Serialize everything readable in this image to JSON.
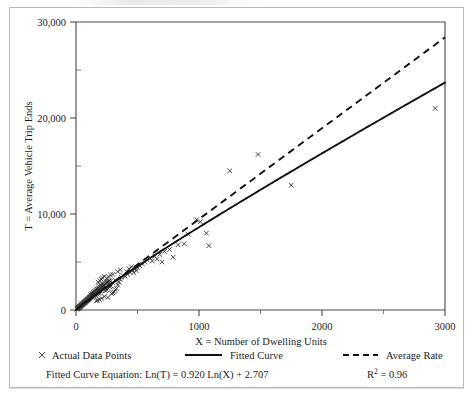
{
  "chart_data": {
    "type": "scatter",
    "title": "",
    "xlabel": "X = Number of Dwelling Units",
    "ylabel": "T = Average Vehicle Trip Ends",
    "xlim": [
      0,
      3000
    ],
    "ylim": [
      0,
      30000
    ],
    "xticks": [
      0,
      1000,
      2000,
      3000
    ],
    "xtick_labels": [
      "0",
      "1000",
      "2000",
      "3000"
    ],
    "yticks": [
      0,
      10000,
      20000,
      30000
    ],
    "ytick_labels": [
      "0",
      "10,000",
      "20,000",
      "30,000"
    ],
    "yticks_minor": [
      5000,
      15000,
      25000
    ],
    "grid": false,
    "legend_position": "below-axes",
    "series": [
      {
        "name": "Actual Data Points",
        "type": "scatter",
        "marker": "x",
        "points": [
          [
            8,
            90
          ],
          [
            12,
            130
          ],
          [
            15,
            160
          ],
          [
            18,
            200
          ],
          [
            20,
            230
          ],
          [
            22,
            250
          ],
          [
            25,
            280
          ],
          [
            28,
            320
          ],
          [
            30,
            350
          ],
          [
            32,
            370
          ],
          [
            35,
            400
          ],
          [
            38,
            430
          ],
          [
            40,
            460
          ],
          [
            42,
            480
          ],
          [
            45,
            510
          ],
          [
            48,
            540
          ],
          [
            50,
            570
          ],
          [
            52,
            600
          ],
          [
            55,
            630
          ],
          [
            58,
            660
          ],
          [
            60,
            690
          ],
          [
            63,
            720
          ],
          [
            65,
            740
          ],
          [
            68,
            780
          ],
          [
            70,
            800
          ],
          [
            73,
            830
          ],
          [
            75,
            860
          ],
          [
            78,
            890
          ],
          [
            80,
            910
          ],
          [
            83,
            950
          ],
          [
            85,
            980
          ],
          [
            88,
            1000
          ],
          [
            90,
            1040
          ],
          [
            93,
            1060
          ],
          [
            95,
            1090
          ],
          [
            98,
            1120
          ],
          [
            100,
            1150
          ],
          [
            103,
            1180
          ],
          [
            105,
            1210
          ],
          [
            108,
            1240
          ],
          [
            110,
            1260
          ],
          [
            113,
            1300
          ],
          [
            115,
            1320
          ],
          [
            118,
            1350
          ],
          [
            120,
            1380
          ],
          [
            123,
            1410
          ],
          [
            125,
            1440
          ],
          [
            128,
            1470
          ],
          [
            130,
            1490
          ],
          [
            133,
            1530
          ],
          [
            135,
            1550
          ],
          [
            138,
            1580
          ],
          [
            140,
            1610
          ],
          [
            143,
            1640
          ],
          [
            145,
            1660
          ],
          [
            148,
            1700
          ],
          [
            150,
            1720
          ],
          [
            155,
            1780
          ],
          [
            160,
            1830
          ],
          [
            165,
            1890
          ],
          [
            170,
            1940
          ],
          [
            175,
            2000
          ],
          [
            180,
            2050
          ],
          [
            185,
            2110
          ],
          [
            190,
            2160
          ],
          [
            195,
            2220
          ],
          [
            200,
            2270
          ],
          [
            205,
            2330
          ],
          [
            210,
            2380
          ],
          [
            215,
            2440
          ],
          [
            220,
            2490
          ],
          [
            225,
            2550
          ],
          [
            230,
            2600
          ],
          [
            235,
            2660
          ],
          [
            240,
            2710
          ],
          [
            245,
            2770
          ],
          [
            250,
            2820
          ],
          [
            255,
            2880
          ],
          [
            260,
            2930
          ],
          [
            265,
            2990
          ],
          [
            270,
            3040
          ],
          [
            150,
            1450
          ],
          [
            160,
            1550
          ],
          [
            170,
            1650
          ],
          [
            180,
            1750
          ],
          [
            190,
            1850
          ],
          [
            200,
            1950
          ],
          [
            210,
            2050
          ],
          [
            220,
            2150
          ],
          [
            230,
            2250
          ],
          [
            240,
            2350
          ],
          [
            120,
            1600
          ],
          [
            130,
            1720
          ],
          [
            140,
            1840
          ],
          [
            150,
            1960
          ],
          [
            160,
            2080
          ],
          [
            170,
            2200
          ],
          [
            180,
            2320
          ],
          [
            190,
            2440
          ],
          [
            200,
            2560
          ],
          [
            215,
            2700
          ],
          [
            180,
            2900
          ],
          [
            195,
            3050
          ],
          [
            205,
            3200
          ],
          [
            215,
            3350
          ],
          [
            230,
            3500
          ],
          [
            240,
            2000
          ],
          [
            250,
            2100
          ],
          [
            260,
            2250
          ],
          [
            275,
            2400
          ],
          [
            285,
            2500
          ],
          [
            290,
            1700
          ],
          [
            300,
            1800
          ],
          [
            310,
            1900
          ],
          [
            320,
            2100
          ],
          [
            330,
            2250
          ],
          [
            250,
            3300
          ],
          [
            265,
            3450
          ],
          [
            280,
            3000
          ],
          [
            300,
            2800
          ],
          [
            320,
            3100
          ],
          [
            340,
            2600
          ],
          [
            350,
            2900
          ],
          [
            360,
            3200
          ],
          [
            370,
            3400
          ],
          [
            380,
            3600
          ],
          [
            400,
            3500
          ],
          [
            420,
            3700
          ],
          [
            440,
            3900
          ],
          [
            460,
            4100
          ],
          [
            480,
            4300
          ],
          [
            340,
            4000
          ],
          [
            360,
            4200
          ],
          [
            300,
            3700
          ],
          [
            280,
            3650
          ],
          [
            260,
            1300
          ],
          [
            210,
            1200
          ],
          [
            230,
            1400
          ],
          [
            190,
            1100
          ],
          [
            175,
            1000
          ],
          [
            165,
            950
          ],
          [
            500,
            4400
          ],
          [
            520,
            4600
          ],
          [
            540,
            4800
          ],
          [
            560,
            5000
          ],
          [
            580,
            5200
          ],
          [
            470,
            3900
          ],
          [
            490,
            4100
          ],
          [
            450,
            4500
          ],
          [
            430,
            4300
          ],
          [
            410,
            4000
          ],
          [
            600,
            5400
          ],
          [
            620,
            5100
          ],
          [
            640,
            5600
          ],
          [
            660,
            5300
          ],
          [
            680,
            5800
          ],
          [
            700,
            5000
          ],
          [
            720,
            6100
          ],
          [
            760,
            6300
          ],
          [
            790,
            5500
          ],
          [
            830,
            6800
          ],
          [
            880,
            6900
          ],
          [
            910,
            7900
          ],
          [
            980,
            9400
          ],
          [
            1010,
            9200
          ],
          [
            1060,
            8000
          ],
          [
            1080,
            6700
          ],
          [
            1250,
            14500
          ],
          [
            1480,
            16200
          ],
          [
            1750,
            13000
          ],
          [
            2920,
            21000
          ]
        ]
      },
      {
        "name": "Fitted Curve",
        "type": "line",
        "style": "solid",
        "equation": "Ln(T) = 0.920 Ln(X) + 2.707",
        "slope_log": 0.92,
        "intercept_log": 2.707,
        "endpoint_at_x3000": 23200
      },
      {
        "name": "Average Rate",
        "type": "line",
        "style": "dashed",
        "rate": 9.47,
        "endpoint_at_x3000": 28400
      }
    ],
    "annotations": {
      "equation_prefix": "Fitted Curve Equation:",
      "equation": "Ln(T) = 0.920 Ln(X) + 2.707",
      "r_squared_symbol": "R",
      "r_squared_exponent": "2",
      "r_squared_value": "= 0.96"
    }
  },
  "legend": {
    "items": [
      {
        "label": "Actual Data Points",
        "marker": "x-marker-icon"
      },
      {
        "label": "Fitted Curve",
        "marker": "solid-line-icon"
      },
      {
        "label": "Average Rate",
        "marker": "dashed-line-icon"
      }
    ]
  }
}
